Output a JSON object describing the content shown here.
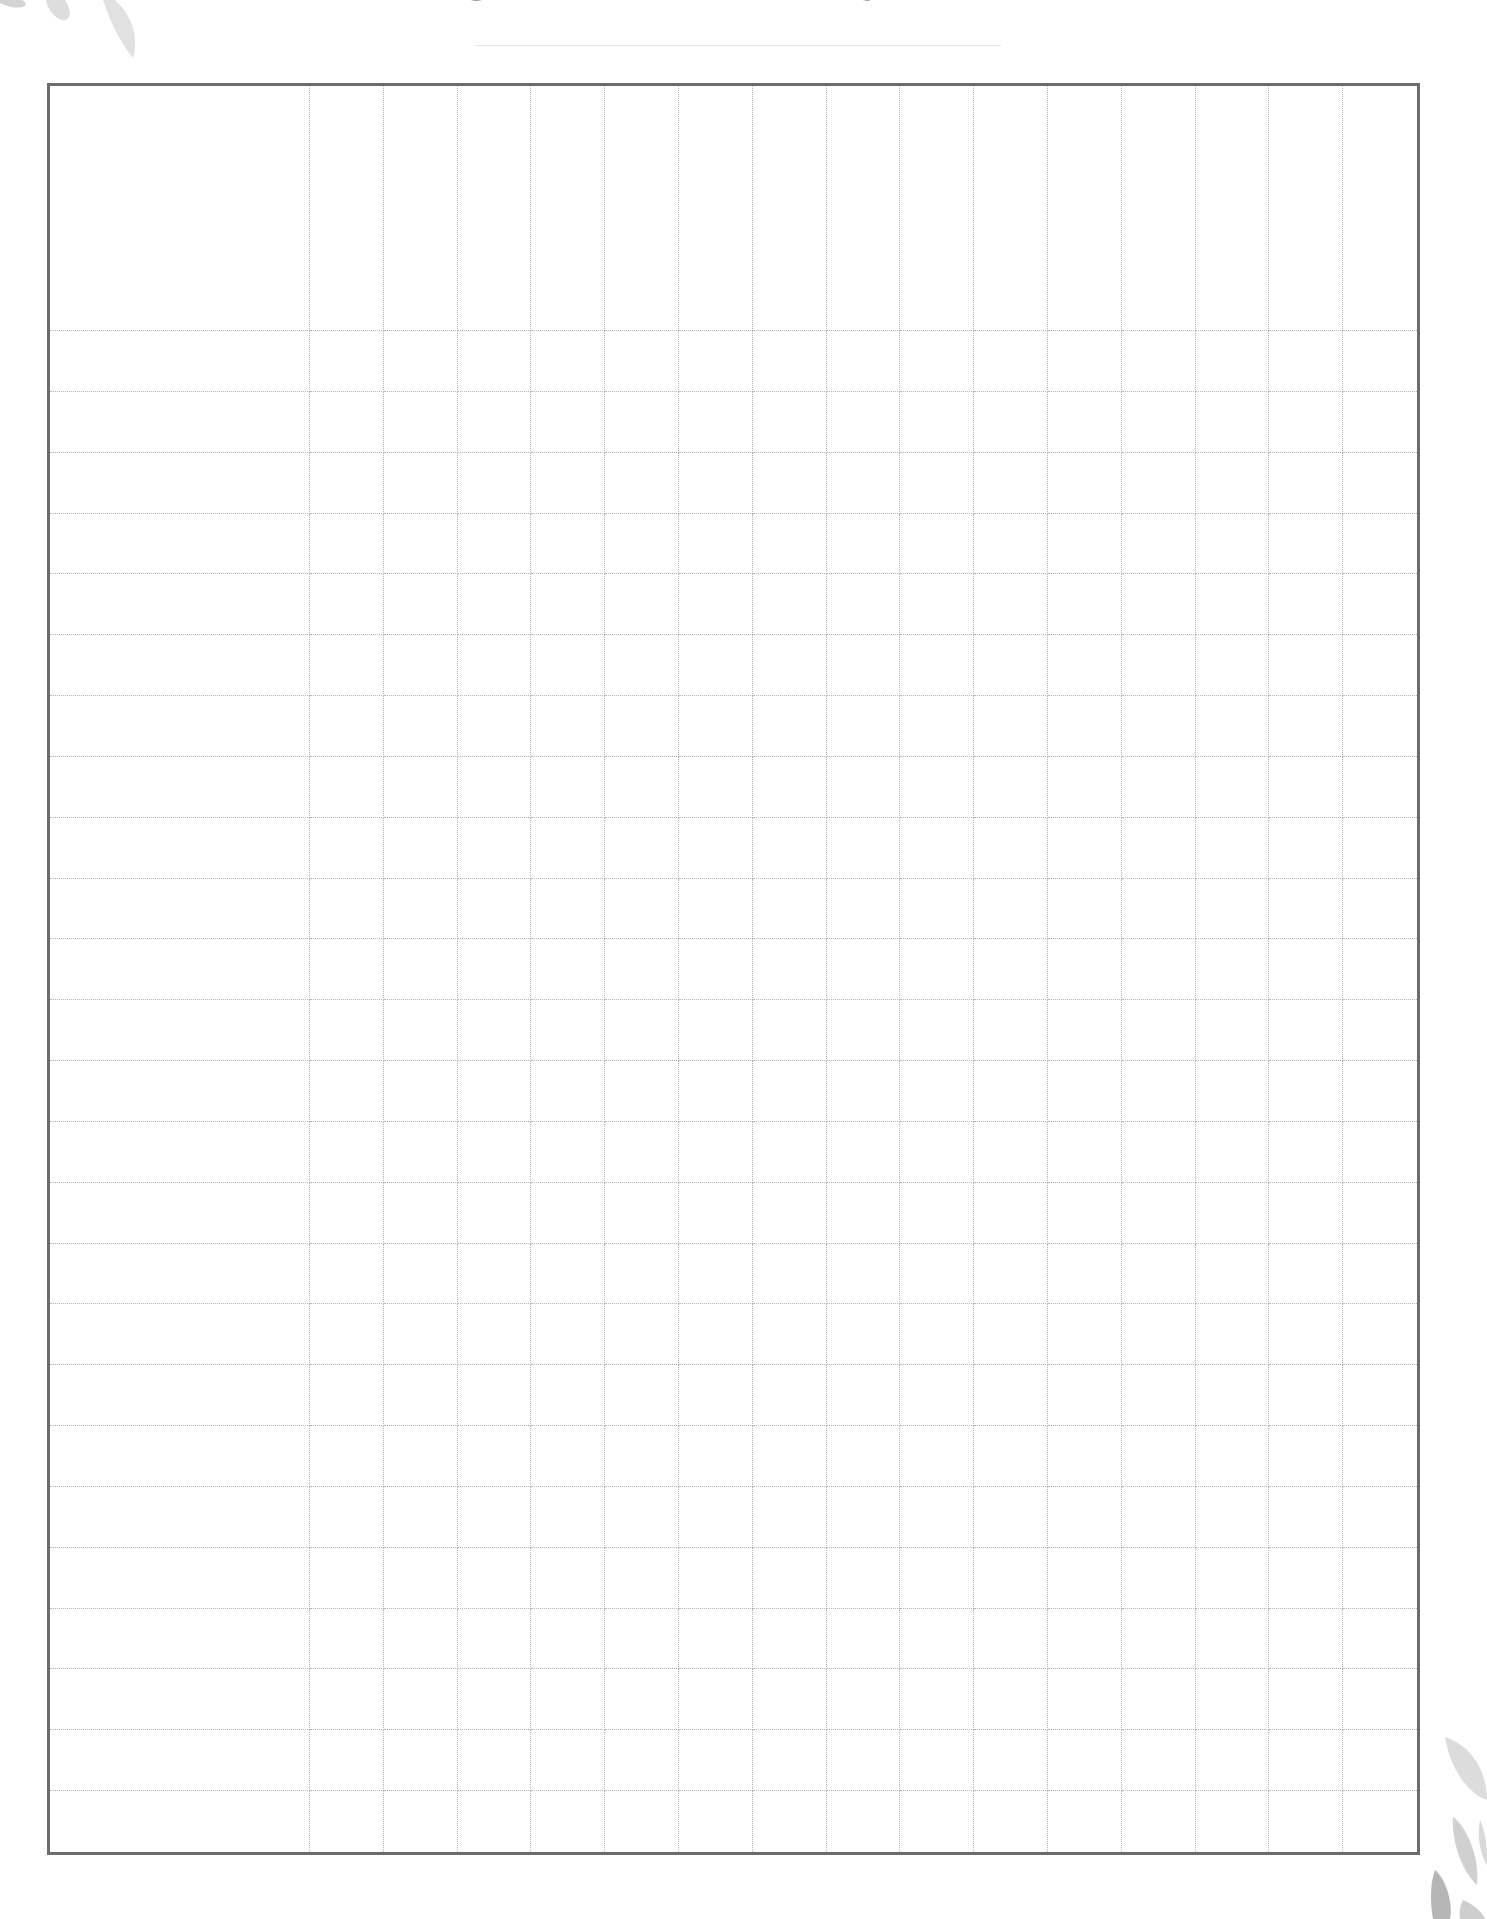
{
  "header": {
    "title": "GRADE TRACKER"
  },
  "colors": {
    "border": "#6c6c6c",
    "grid_line": "#b5b5b5",
    "title_text": "#2b2b2b",
    "leaf": "#c9c9c9"
  },
  "decorations": {
    "top_left": "watercolor-leaf-icon",
    "bottom_right": "watercolor-leaf-icon"
  },
  "tracker": {
    "header_row": {
      "name_header": "",
      "assignment_headers": [
        "",
        "",
        "",
        "",
        "",
        "",
        "",
        "",
        "",
        "",
        "",
        "",
        "",
        "",
        ""
      ]
    },
    "column_count": 16,
    "assignment_column_count": 15,
    "student_row_count": 25,
    "rows": [
      {
        "name": "",
        "grades": [
          "",
          "",
          "",
          "",
          "",
          "",
          "",
          "",
          "",
          "",
          "",
          "",
          "",
          "",
          ""
        ]
      },
      {
        "name": "",
        "grades": [
          "",
          "",
          "",
          "",
          "",
          "",
          "",
          "",
          "",
          "",
          "",
          "",
          "",
          "",
          ""
        ]
      },
      {
        "name": "",
        "grades": [
          "",
          "",
          "",
          "",
          "",
          "",
          "",
          "",
          "",
          "",
          "",
          "",
          "",
          "",
          ""
        ]
      },
      {
        "name": "",
        "grades": [
          "",
          "",
          "",
          "",
          "",
          "",
          "",
          "",
          "",
          "",
          "",
          "",
          "",
          "",
          ""
        ]
      },
      {
        "name": "",
        "grades": [
          "",
          "",
          "",
          "",
          "",
          "",
          "",
          "",
          "",
          "",
          "",
          "",
          "",
          "",
          ""
        ]
      },
      {
        "name": "",
        "grades": [
          "",
          "",
          "",
          "",
          "",
          "",
          "",
          "",
          "",
          "",
          "",
          "",
          "",
          "",
          ""
        ]
      },
      {
        "name": "",
        "grades": [
          "",
          "",
          "",
          "",
          "",
          "",
          "",
          "",
          "",
          "",
          "",
          "",
          "",
          "",
          ""
        ]
      },
      {
        "name": "",
        "grades": [
          "",
          "",
          "",
          "",
          "",
          "",
          "",
          "",
          "",
          "",
          "",
          "",
          "",
          "",
          ""
        ]
      },
      {
        "name": "",
        "grades": [
          "",
          "",
          "",
          "",
          "",
          "",
          "",
          "",
          "",
          "",
          "",
          "",
          "",
          "",
          ""
        ]
      },
      {
        "name": "",
        "grades": [
          "",
          "",
          "",
          "",
          "",
          "",
          "",
          "",
          "",
          "",
          "",
          "",
          "",
          "",
          ""
        ]
      },
      {
        "name": "",
        "grades": [
          "",
          "",
          "",
          "",
          "",
          "",
          "",
          "",
          "",
          "",
          "",
          "",
          "",
          "",
          ""
        ]
      },
      {
        "name": "",
        "grades": [
          "",
          "",
          "",
          "",
          "",
          "",
          "",
          "",
          "",
          "",
          "",
          "",
          "",
          "",
          ""
        ]
      },
      {
        "name": "",
        "grades": [
          "",
          "",
          "",
          "",
          "",
          "",
          "",
          "",
          "",
          "",
          "",
          "",
          "",
          "",
          ""
        ]
      },
      {
        "name": "",
        "grades": [
          "",
          "",
          "",
          "",
          "",
          "",
          "",
          "",
          "",
          "",
          "",
          "",
          "",
          "",
          ""
        ]
      },
      {
        "name": "",
        "grades": [
          "",
          "",
          "",
          "",
          "",
          "",
          "",
          "",
          "",
          "",
          "",
          "",
          "",
          "",
          ""
        ]
      },
      {
        "name": "",
        "grades": [
          "",
          "",
          "",
          "",
          "",
          "",
          "",
          "",
          "",
          "",
          "",
          "",
          "",
          "",
          ""
        ]
      },
      {
        "name": "",
        "grades": [
          "",
          "",
          "",
          "",
          "",
          "",
          "",
          "",
          "",
          "",
          "",
          "",
          "",
          "",
          ""
        ]
      },
      {
        "name": "",
        "grades": [
          "",
          "",
          "",
          "",
          "",
          "",
          "",
          "",
          "",
          "",
          "",
          "",
          "",
          "",
          ""
        ]
      },
      {
        "name": "",
        "grades": [
          "",
          "",
          "",
          "",
          "",
          "",
          "",
          "",
          "",
          "",
          "",
          "",
          "",
          "",
          ""
        ]
      },
      {
        "name": "",
        "grades": [
          "",
          "",
          "",
          "",
          "",
          "",
          "",
          "",
          "",
          "",
          "",
          "",
          "",
          "",
          ""
        ]
      },
      {
        "name": "",
        "grades": [
          "",
          "",
          "",
          "",
          "",
          "",
          "",
          "",
          "",
          "",
          "",
          "",
          "",
          "",
          ""
        ]
      },
      {
        "name": "",
        "grades": [
          "",
          "",
          "",
          "",
          "",
          "",
          "",
          "",
          "",
          "",
          "",
          "",
          "",
          "",
          ""
        ]
      },
      {
        "name": "",
        "grades": [
          "",
          "",
          "",
          "",
          "",
          "",
          "",
          "",
          "",
          "",
          "",
          "",
          "",
          "",
          ""
        ]
      },
      {
        "name": "",
        "grades": [
          "",
          "",
          "",
          "",
          "",
          "",
          "",
          "",
          "",
          "",
          "",
          "",
          "",
          "",
          ""
        ]
      },
      {
        "name": "",
        "grades": [
          "",
          "",
          "",
          "",
          "",
          "",
          "",
          "",
          "",
          "",
          "",
          "",
          "",
          "",
          ""
        ]
      }
    ]
  }
}
